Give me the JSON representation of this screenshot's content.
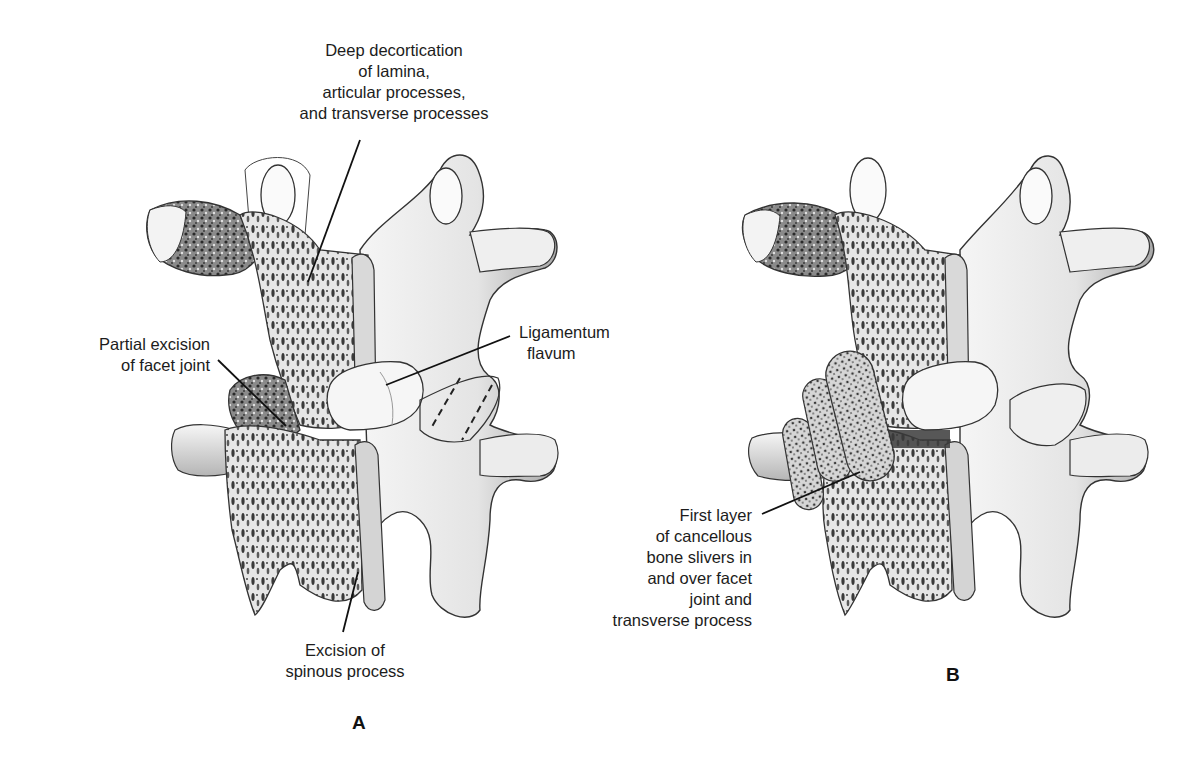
{
  "figure": {
    "panels": [
      {
        "id": "A",
        "letter": "A",
        "labels": {
          "decortication": [
            "Deep decortication",
            "of lamina,",
            "articular processes,",
            "and transverse processes"
          ],
          "facet_excision": [
            "Partial excision",
            "of facet joint"
          ],
          "ligamentum": [
            "Ligamentum",
            "flavum"
          ],
          "spinous_excision": [
            "Excision of",
            "spinous process"
          ]
        }
      },
      {
        "id": "B",
        "letter": "B",
        "labels": {
          "bone_slivers": [
            "First layer",
            "of cancellous",
            "bone slivers in",
            "and over facet",
            "joint and",
            "transverse process"
          ]
        }
      }
    ],
    "colors": {
      "ink": "#1a1a1a",
      "bone_light": "#f2f2f2",
      "bone_mid": "#bdbdbd",
      "bone_dark": "#555555",
      "background": "#ffffff"
    }
  }
}
